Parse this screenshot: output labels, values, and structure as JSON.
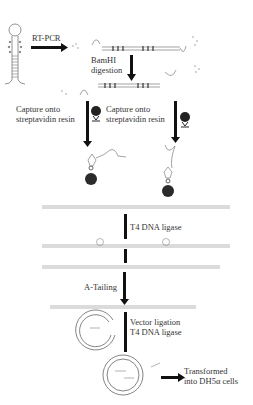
{
  "diagram": {
    "type": "workflow",
    "steps": [
      {
        "id": "rt_pcr",
        "label": "RT-PCR"
      },
      {
        "id": "bamhi",
        "label_line1": "BamHI",
        "label_line2": "digestion"
      },
      {
        "id": "capture_left",
        "label_line1": "Capture onto",
        "label_line2": "streptavidin resin"
      },
      {
        "id": "capture_right",
        "label_line1": "Capture onto",
        "label_line2": "streptavidin resin"
      },
      {
        "id": "ligase",
        "label": "T4 DNA ligase"
      },
      {
        "id": "a_tailing",
        "label": "A-Tailing"
      },
      {
        "id": "vector",
        "label_line1": "Vector ligation",
        "label_line2": "T4 DNA ligase"
      },
      {
        "id": "transform",
        "label_line1": "Transformed",
        "label_line2": "into DH5α cells"
      }
    ],
    "colors": {
      "arrow": "#111111",
      "bead": "#2b2b2b",
      "strand": "#888888",
      "text": "#333333"
    }
  }
}
